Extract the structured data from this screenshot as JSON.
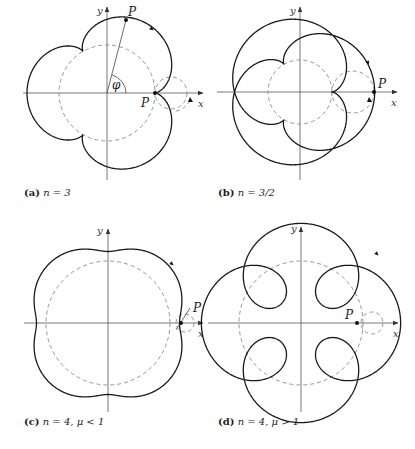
{
  "panels": [
    {
      "id": "a",
      "caption_tag": "(a)",
      "caption_expr": "n = 3",
      "n": 3,
      "kind": "epicycloid",
      "center": [
        107,
        93
      ],
      "fixed_radius": 48,
      "rolling_radius": 16,
      "labels": {
        "x": "x",
        "y": "y",
        "point_top": "P",
        "point_cusp": "P",
        "angle": "φ"
      }
    },
    {
      "id": "b",
      "caption_tag": "(b)",
      "caption_expr": "n = 3/2",
      "n": 1.5,
      "kind": "epicycloid",
      "center": [
        300,
        92
      ],
      "fixed_radius": 32,
      "rolling_radius": 21.33,
      "labels": {
        "x": "x",
        "y": "y",
        "point": "P"
      }
    },
    {
      "id": "c",
      "caption_tag": "(c)",
      "caption_expr": "n = 4,  μ < 1",
      "n": 4,
      "mu": "< 1",
      "kind": "epitrochoid",
      "center": [
        108,
        323
      ],
      "fixed_radius": 62,
      "labels": {
        "x": "x",
        "y": "y",
        "point": "P"
      }
    },
    {
      "id": "d",
      "caption_tag": "(d)",
      "caption_expr": "n = 4,  μ > 1",
      "n": 4,
      "mu": "> 1",
      "kind": "epitrochoid",
      "center": [
        301,
        323
      ],
      "fixed_radius": 62,
      "labels": {
        "x": "x",
        "y": "y",
        "point": "P"
      }
    }
  ],
  "colors": {
    "curve": "#1a1a1a",
    "dashed": "#8a8a8a",
    "axis": "#555555"
  }
}
